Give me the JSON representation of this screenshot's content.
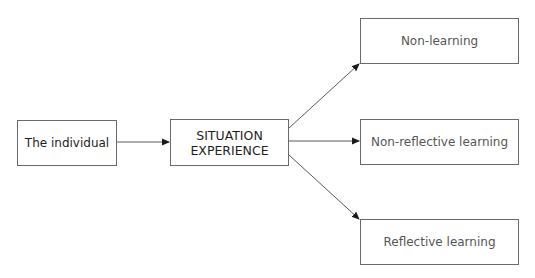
{
  "diagram": {
    "nodes": {
      "individual": "The individual",
      "situation_line1": "SITUATION",
      "situation_line2": "EXPERIENCE",
      "non_learning": "Non-learning",
      "non_reflective_learning": "Non-reflective learning",
      "reflective_learning": "Reflective learning"
    },
    "edges": [
      {
        "from": "individual",
        "to": "situation"
      },
      {
        "from": "situation",
        "to": "non_learning"
      },
      {
        "from": "situation",
        "to": "non_reflective_learning"
      },
      {
        "from": "situation",
        "to": "reflective_learning"
      }
    ],
    "colors": {
      "line": "#5a5a5a",
      "arrowhead": "#1a1a1a"
    }
  }
}
